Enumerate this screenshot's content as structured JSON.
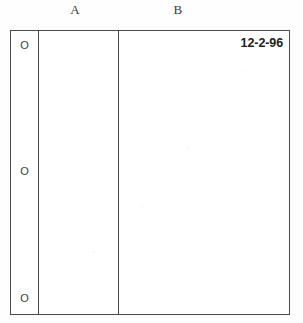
{
  "document": {
    "kind": "scanned-form-page",
    "background_color": "#fefefe",
    "ink_color": "#4a4a4a"
  },
  "column_headers": [
    {
      "label": "A",
      "name": "column-header-a"
    },
    {
      "label": "B",
      "name": "column-header-b"
    }
  ],
  "binder_holes": {
    "glyph": "O",
    "marks": [
      {
        "label": "O",
        "position": "top"
      },
      {
        "label": "O",
        "position": "middle"
      },
      {
        "label": "O",
        "position": "bottom"
      }
    ]
  },
  "columns": {
    "hole_margin": {
      "content": ""
    },
    "a": {
      "header": "A",
      "content": ""
    },
    "b": {
      "header": "B",
      "content": ""
    }
  },
  "entries": {
    "date": "12-2-96"
  }
}
